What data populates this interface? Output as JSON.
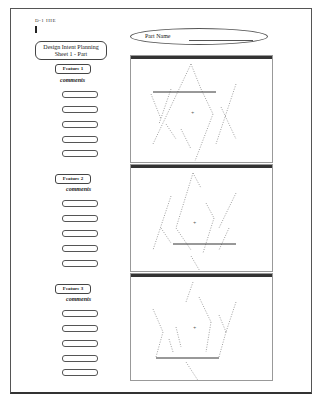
{
  "header": {
    "doc_id": "D-1 IIIE"
  },
  "title_box": {
    "line1": "Design Intent Planning",
    "line2": "Sheet 1 - Part"
  },
  "part_name": {
    "label": "Part Name"
  },
  "sections": [
    {
      "feature_label": "Feature 1",
      "comments_label": "comments",
      "comment_fields": [
        "",
        "",
        "",
        "",
        ""
      ]
    },
    {
      "feature_label": "Feature 2",
      "comments_label": "comments",
      "comment_fields": [
        "",
        "",
        "",
        "",
        ""
      ]
    },
    {
      "feature_label": "Feature 3",
      "comments_label": "comments",
      "comment_fields": [
        "",
        "",
        "",
        "",
        ""
      ]
    }
  ],
  "colors": {
    "frame": "#555555",
    "titlebar": "#333333",
    "sketch": "#666666"
  }
}
